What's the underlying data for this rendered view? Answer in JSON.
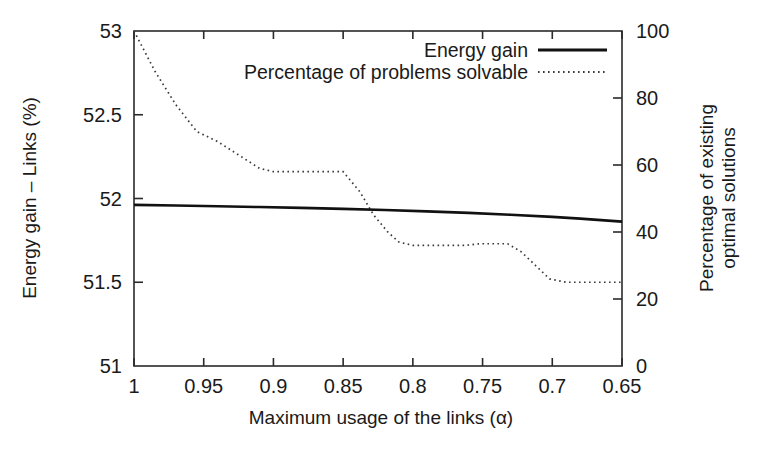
{
  "chart_data": {
    "type": "line",
    "title": "",
    "xlabel": "Maximum usage of the links (α)",
    "ylabel_left": "Energy gain – Links (%)",
    "ylabel_right_line1": "Percentage of existing",
    "ylabel_right_line2": "optimal solutions",
    "grid": false,
    "legend_position": "top-right inside plot",
    "xlim": [
      1.0,
      0.65
    ],
    "x_inverted": true,
    "x_ticks": [
      1,
      0.95,
      0.9,
      0.85,
      0.8,
      0.75,
      0.7,
      0.65
    ],
    "x_tick_labels": [
      "1",
      "0.95",
      "0.9",
      "0.85",
      "0.8",
      "0.75",
      "0.7",
      "0.65"
    ],
    "ylim_left": [
      51,
      53
    ],
    "y_ticks_left": [
      51,
      51.5,
      52,
      52.5,
      53
    ],
    "y_tick_labels_left": [
      "51",
      "51.5",
      "52",
      "52.5",
      "53"
    ],
    "ylim_right": [
      0,
      100
    ],
    "y_ticks_right": [
      0,
      20,
      40,
      60,
      80,
      100
    ],
    "y_tick_labels_right": [
      "0",
      "20",
      "40",
      "60",
      "80",
      "100"
    ],
    "series": [
      {
        "name": "Energy gain",
        "axis": "left",
        "style": "solid",
        "color": "#111111",
        "x": [
          1.0,
          0.97,
          0.94,
          0.91,
          0.88,
          0.85,
          0.82,
          0.79,
          0.76,
          0.73,
          0.7,
          0.68,
          0.65
        ],
        "y": [
          51.962,
          51.958,
          51.954,
          51.949,
          51.944,
          51.938,
          51.931,
          51.923,
          51.914,
          51.903,
          51.89,
          51.88,
          51.862
        ]
      },
      {
        "name": "Percentage of problems solvable",
        "axis": "right",
        "style": "dotted",
        "color": "#3a3a3a",
        "x": [
          1.0,
          0.985,
          0.97,
          0.955,
          0.94,
          0.925,
          0.91,
          0.9,
          0.885,
          0.87,
          0.855,
          0.85,
          0.838,
          0.828,
          0.818,
          0.81,
          0.8,
          0.788,
          0.78,
          0.772,
          0.762,
          0.752,
          0.742,
          0.732,
          0.722,
          0.712,
          0.702,
          0.69,
          0.675,
          0.65
        ],
        "y": [
          100,
          88,
          78,
          70,
          67,
          63,
          59,
          58,
          58,
          58,
          58,
          58,
          52,
          45,
          40,
          37,
          36,
          36,
          36,
          36,
          36,
          36.5,
          36.5,
          36.5,
          34,
          30,
          26,
          25,
          25,
          25
        ]
      }
    ],
    "legend": [
      {
        "label": "Energy gain",
        "style": "solid"
      },
      {
        "label": "Percentage of problems solvable",
        "style": "dotted"
      }
    ]
  }
}
